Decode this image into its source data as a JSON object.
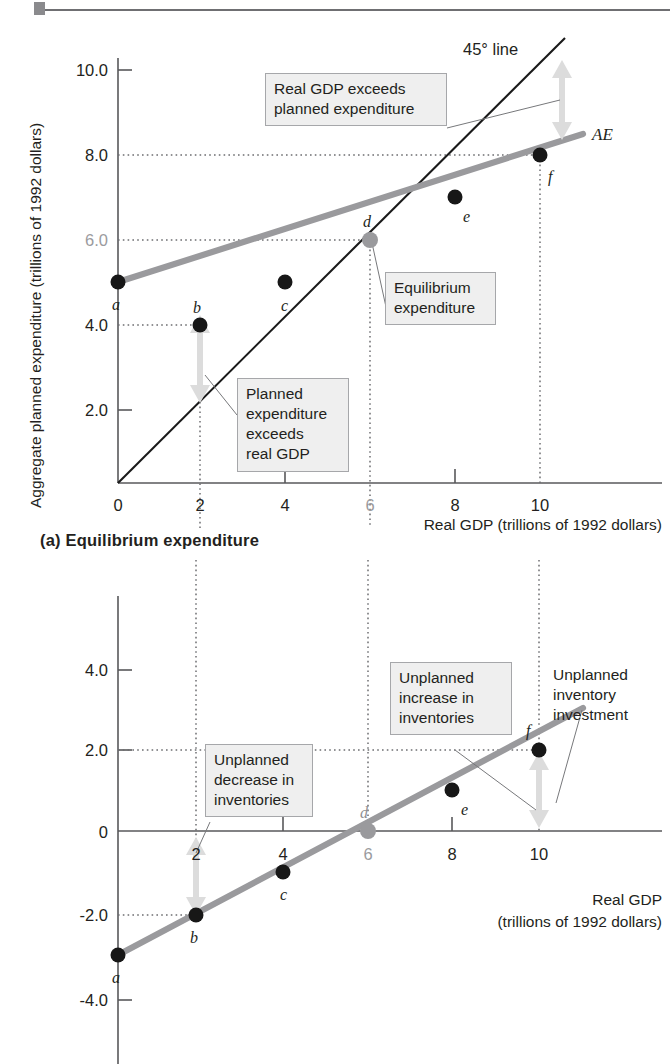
{
  "figure": {
    "panel_a_caption": "(a) Equilibrium expenditure"
  },
  "panel_a": {
    "y_axis_title": "Aggregate planned expenditure (trillions of 1992 dollars)",
    "x_axis_title": "Real GDP (trillions of 1992 dollars)",
    "y_ticks": [
      "2.0",
      "4.0",
      "6.0",
      "8.0",
      "10.0"
    ],
    "x_ticks": [
      "0",
      "2",
      "4",
      "6",
      "8",
      "10"
    ],
    "equilibrium_tick_x": "6",
    "equilibrium_tick_y": "6.0",
    "series_label_ae": "AE",
    "series_label_45": "45° line",
    "point_labels": [
      "a",
      "b",
      "c",
      "d",
      "e",
      "f"
    ],
    "callout_real_gdp_exceeds": "Real GDP exceeds\nplanned expenditure",
    "callout_planned_exceeds": "Planned\nexpenditure\nexceeds\nreal GDP",
    "callout_equilibrium": "Equilibrium\nexpenditure"
  },
  "panel_b": {
    "y_axis_title": "Unplanned inventory change (trillions of 1992 dollars)",
    "x_axis_title_line1": "Real GDP",
    "x_axis_title_line2": "(trillions of 1992 dollars)",
    "y_ticks": [
      "-4.0",
      "-2.0",
      "0",
      "2.0",
      "4.0"
    ],
    "x_ticks": [
      "2",
      "4",
      "6",
      "8",
      "10"
    ],
    "equilibrium_tick_x": "6",
    "point_labels": [
      "a",
      "b",
      "c",
      "d",
      "e",
      "f"
    ],
    "callout_decrease": "Unplanned\ndecrease in\ninventories",
    "callout_increase": "Unplanned\nincrease in\ninventories",
    "text_investment": "Unplanned\ninventory\ninvestment"
  },
  "colors": {
    "ae_line": "#9a9a9d",
    "line_45": "#1a1a1a",
    "point": "#171717",
    "equilibrium_point": "#9a9a9d",
    "arrow": "#dcdcdc",
    "axis": "#58585b",
    "callout_bg": "#efefef",
    "callout_border": "#a6a7aa"
  },
  "chart_data": [
    {
      "type": "line",
      "id": "panel-a",
      "title": "(a) Equilibrium expenditure",
      "xlabel": "Real GDP (trillions of 1992 dollars)",
      "ylabel": "Aggregate planned expenditure (trillions of 1992 dollars)",
      "xlim": [
        0,
        12
      ],
      "ylim": [
        0,
        11
      ],
      "xticks": [
        0,
        2,
        4,
        6,
        8,
        10
      ],
      "yticks": [
        2.0,
        4.0,
        6.0,
        8.0,
        10.0
      ],
      "grid": false,
      "legend": "inline-labels",
      "series": [
        {
          "name": "AE",
          "kind": "aggregate-planned-expenditure",
          "x": [
            0,
            2,
            4,
            6,
            8,
            10
          ],
          "y": [
            3.0,
            4.0,
            5.0,
            6.0,
            7.0,
            8.0
          ],
          "point_labels": [
            "a",
            "b",
            "c",
            "d",
            "e",
            "f"
          ],
          "color": "#9a9a9d"
        },
        {
          "name": "45° line",
          "kind": "forty-five-degree",
          "x": [
            0,
            10.5
          ],
          "y": [
            0,
            10.5
          ],
          "color": "#1a1a1a"
        }
      ],
      "equilibrium": {
        "label": "d",
        "x": 6,
        "y": 6.0
      },
      "annotations": [
        {
          "text": "Real GDP exceeds planned expenditure",
          "points_to": [
            10,
            9
          ]
        },
        {
          "text": "Planned expenditure exceeds real GDP",
          "points_to": [
            2,
            3
          ]
        },
        {
          "text": "Equilibrium expenditure",
          "points_to": [
            6,
            6
          ]
        },
        {
          "text": "45° line",
          "points_to": [
            9.5,
            10.2
          ]
        },
        {
          "text": "AE",
          "points_to": [
            11,
            8.4
          ]
        }
      ]
    },
    {
      "type": "line",
      "id": "panel-b",
      "title": "",
      "xlabel": "Real GDP (trillions of 1992 dollars)",
      "ylabel": "Unplanned inventory change (trillions of 1992 dollars)",
      "xlim": [
        0,
        12
      ],
      "ylim": [
        -5,
        5
      ],
      "xticks": [
        2,
        4,
        6,
        8,
        10
      ],
      "yticks": [
        -4.0,
        -2.0,
        0,
        2.0,
        4.0
      ],
      "grid": false,
      "series": [
        {
          "name": "Unplanned inventory investment",
          "x": [
            0,
            2,
            4,
            6,
            8,
            10
          ],
          "y": [
            -3.0,
            -2.0,
            -1.0,
            0.0,
            1.0,
            2.0
          ],
          "point_labels": [
            "a",
            "b",
            "c",
            "d",
            "e",
            "f"
          ],
          "color": "#9a9a9d"
        }
      ],
      "equilibrium": {
        "label": "d",
        "x": 6,
        "y": 0.0
      },
      "annotations": [
        {
          "text": "Unplanned decrease in inventories",
          "points_to": [
            2,
            -1
          ]
        },
        {
          "text": "Unplanned increase in inventories",
          "points_to": [
            10,
            1
          ]
        },
        {
          "text": "Unplanned inventory investment",
          "points_to": [
            10,
            2
          ]
        }
      ]
    }
  ]
}
